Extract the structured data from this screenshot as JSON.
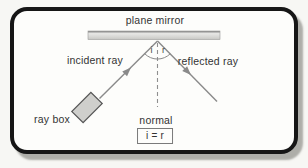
{
  "diagram": {
    "type": "physics-ray-reflection-diagram",
    "labels": {
      "plane_mirror": "plane mirror",
      "incident_ray": "incident ray",
      "reflected_ray": "reflected ray",
      "ray_box": "ray box",
      "normal": "normal",
      "angle_incidence": "i",
      "angle_reflection": "r",
      "law": "i = r"
    },
    "colors": {
      "page_bg": "#f7f7f4",
      "frame_border": "#161616",
      "frame_bg": "#fdfdfb",
      "frame_shadow": "#b9b9b4",
      "mirror_dark": "#7d7d7d",
      "mirror_light": "#e7e7e5",
      "mirror_mid": "#c6c6c3",
      "ray": "#8a8a8a",
      "ray_box_fill": "#cfcfcc",
      "ray_box_border": "#565656",
      "text": "#333333",
      "law_box_border": "#7a7a7a"
    }
  }
}
